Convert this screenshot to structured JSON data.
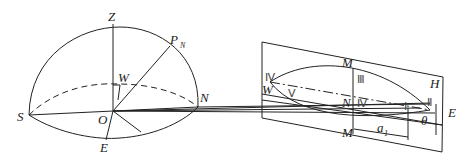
{
  "diagram": {
    "type": "celestial-sphere-and-projection-plane",
    "left_figure": {
      "labels": {
        "zenith": "Z",
        "pole": "P",
        "pole_sub": "N",
        "west": "W",
        "north": "N",
        "south": "S",
        "origin": "O",
        "east": "E"
      }
    },
    "right_figure": {
      "labels": {
        "m_top": "M",
        "m_bottom": "M",
        "n_center": "N",
        "w_left": "W",
        "h_plane": "H",
        "e_right": "E",
        "a_label": "a",
        "a_sub": "1",
        "theta": "θ"
      },
      "roman_numerals": {
        "iv_left": "Ⅳ",
        "v": "Ⅴ",
        "iii_top": "Ⅲ",
        "iv_center": "Ⅳ",
        "i": "Ⅰ",
        "ii": "Ⅱ"
      }
    }
  }
}
